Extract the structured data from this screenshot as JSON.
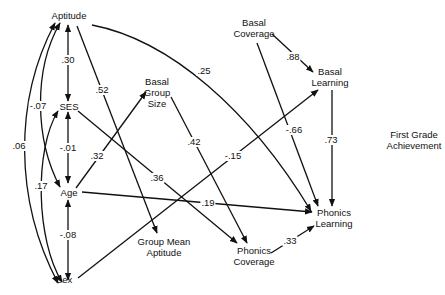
{
  "diagram": {
    "type": "path-analysis",
    "outcome_label": "First Grade Achievement",
    "nodes": {
      "aptitude": "Aptitude",
      "ses": "SES",
      "age": "Age",
      "sex": "Sex",
      "basal_group_size_1": "Basal",
      "basal_group_size_2": "Group",
      "basal_group_size_3": "Size",
      "group_mean_aptitude_1": "Group Mean",
      "group_mean_aptitude_2": "Aptitude",
      "basal_coverage_1": "Basal",
      "basal_coverage_2": "Coverage",
      "basal_learning_1": "Basal",
      "basal_learning_2": "Learning",
      "phonics_coverage_1": "Phonics",
      "phonics_coverage_2": "Coverage",
      "phonics_learning_1": "Phonics",
      "phonics_learning_2": "Learning",
      "first_grade_1": "First Grade",
      "first_grade_2": "Achievement"
    },
    "edges": [
      {
        "from": "Aptitude",
        "to": "SES",
        "coef": ".30",
        "kind": "correlation"
      },
      {
        "from": "SES",
        "to": "Age",
        "coef": "-.01",
        "kind": "correlation"
      },
      {
        "from": "Age",
        "to": "Sex",
        "coef": "-.08",
        "kind": "correlation"
      },
      {
        "from": "Aptitude",
        "to": "Age",
        "coef": "-.07",
        "kind": "correlation"
      },
      {
        "from": "Aptitude",
        "to": "Sex",
        "coef": ".06",
        "kind": "correlation"
      },
      {
        "from": "SES",
        "to": "Sex",
        "coef": ".17",
        "kind": "correlation"
      },
      {
        "from": "Aptitude",
        "to": "Group Mean Aptitude",
        "coef": ".52",
        "kind": "path"
      },
      {
        "from": "Aptitude",
        "to": "Phonics Learning",
        "coef": ".25",
        "kind": "path"
      },
      {
        "from": "Age",
        "to": "Basal Group Size",
        "coef": ".32",
        "kind": "path"
      },
      {
        "from": "SES",
        "to": "Phonics Coverage",
        "coef": ".36",
        "kind": "path"
      },
      {
        "from": "Basal Group Size",
        "to": "Phonics Coverage",
        "coef": ".42",
        "kind": "path"
      },
      {
        "from": "Sex",
        "to": "Basal Learning",
        "coef": "-.15",
        "kind": "path"
      },
      {
        "from": "Age",
        "to": "Phonics Learning",
        "coef": ".19",
        "kind": "path"
      },
      {
        "from": "Basal Coverage",
        "to": "Basal Learning",
        "coef": ".88",
        "kind": "path"
      },
      {
        "from": "Basal Coverage",
        "to": "Phonics Learning",
        "coef": "-.66",
        "kind": "path"
      },
      {
        "from": "Basal Learning",
        "to": "Phonics Learning",
        "coef": ".73",
        "kind": "path"
      },
      {
        "from": "Phonics Coverage",
        "to": "Phonics Learning",
        "coef": ".33",
        "kind": "path"
      }
    ],
    "coefficients": {
      "aptitude_ses": ".30",
      "ses_age": "-.01",
      "age_sex": "-.08",
      "aptitude_age": "-.07",
      "aptitude_sex": ".06",
      "ses_sex": ".17",
      "aptitude_gma": ".52",
      "aptitude_pl": ".25",
      "age_bgs": ".32",
      "ses_pc": ".36",
      "bgs_pc": ".42",
      "sex_bl": "-.15",
      "age_pl": ".19",
      "bc_bl": ".88",
      "bc_pl": "-.66",
      "bl_pl": ".73",
      "pc_pl": ".33"
    },
    "colors": {
      "line": "#111111",
      "background": "#ffffff"
    }
  }
}
